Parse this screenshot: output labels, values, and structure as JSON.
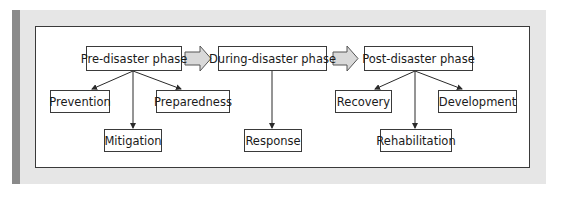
{
  "diagram": {
    "phases": [
      {
        "label": "Pre-disaster phase",
        "children": [
          "Prevention",
          "Mitigation",
          "Preparedness"
        ]
      },
      {
        "label": "During-disaster phase",
        "children": [
          "Response"
        ]
      },
      {
        "label": "Post-disaster phase",
        "children": [
          "Recovery",
          "Rehabilitation",
          "Development"
        ]
      }
    ],
    "colors": {
      "panel_background": "#e6e6e6",
      "panel_stripe": "#8a8a8a",
      "box_border": "#3a3a3a",
      "block_arrow_fill": "#d9d9d9"
    }
  }
}
